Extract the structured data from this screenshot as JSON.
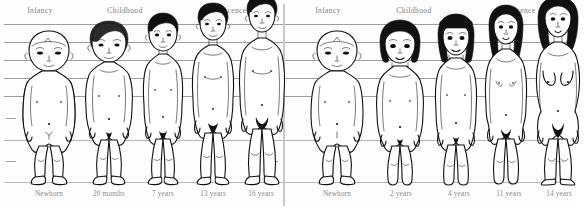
{
  "figure": {
    "type": "comparative-anatomy-diagram",
    "panels": [
      {
        "id": "male",
        "sex": "male",
        "stage_headers": [
          {
            "label": "Infancy",
            "x_center_pct": 13
          },
          {
            "label": "Childhood",
            "x_center_pct": 44
          },
          {
            "label": "Pubescence",
            "x_center_pct": 79
          }
        ],
        "figures": [
          {
            "age_label": "Newborn",
            "stage": "Infancy",
            "relative_height_pct": 30
          },
          {
            "age_label": "20 months",
            "stage": "Childhood",
            "relative_height_pct": 45
          },
          {
            "age_label": "7 years",
            "stage": "Childhood",
            "relative_height_pct": 62
          },
          {
            "age_label": "13 years",
            "stage": "Pubescence",
            "relative_height_pct": 80
          },
          {
            "age_label": "16 years",
            "stage": "Pubescence",
            "relative_height_pct": 95
          }
        ]
      },
      {
        "id": "female",
        "sex": "female",
        "stage_headers": [
          {
            "label": "Infancy",
            "x_center_pct": 13
          },
          {
            "label": "Childhood",
            "x_center_pct": 44
          },
          {
            "label": "Pubescence",
            "x_center_pct": 79
          }
        ],
        "figures": [
          {
            "age_label": "Newborn",
            "stage": "Infancy",
            "relative_height_pct": 30
          },
          {
            "age_label": "2 years",
            "stage": "Childhood",
            "relative_height_pct": 46
          },
          {
            "age_label": "4 years",
            "stage": "Childhood",
            "relative_height_pct": 56
          },
          {
            "age_label": "11 years",
            "stage": "Pubescence",
            "relative_height_pct": 78
          },
          {
            "age_label": "14 years",
            "stage": "Pubescence",
            "relative_height_pct": 92
          }
        ]
      }
    ],
    "gridlines": {
      "count": 7,
      "y_positions": [
        24,
        42,
        60,
        78,
        96,
        140,
        182
      ],
      "color": "#8d8d8d"
    },
    "colors": {
      "background": "#fdfdfd",
      "outline": "#111111",
      "gridline": "#8d8d8d",
      "divider": "#c9c9c9",
      "label_text": "#8a8a8a",
      "header_text": "#7d7d7d"
    }
  }
}
